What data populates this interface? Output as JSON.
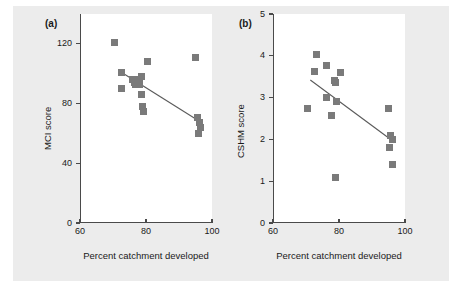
{
  "figure": {
    "background_color": "#ececec",
    "plot_background_color": "#ffffff",
    "marker_color": "#7a7a7a",
    "axis_color": "#4a4a4a",
    "line_color": "#5a5a5a"
  },
  "chart_data": [
    {
      "type": "scatter",
      "panel_label": "(a)",
      "title": "",
      "xlabel": "Percent catchment developed",
      "ylabel": "MCI score",
      "xlim": [
        60,
        100
      ],
      "ylim": [
        0,
        140
      ],
      "xticks": [
        60,
        80,
        100
      ],
      "xtick_labels": [
        "60",
        "80",
        "100"
      ],
      "yticks": [
        0,
        40,
        80,
        120
      ],
      "ytick_labels": [
        "0",
        "40",
        "80",
        "120"
      ],
      "grid": false,
      "legend": "none",
      "points": [
        {
          "x": 70.2,
          "y": 121
        },
        {
          "x": 72.3,
          "y": 101
        },
        {
          "x": 72.4,
          "y": 90
        },
        {
          "x": 75.6,
          "y": 96
        },
        {
          "x": 76.2,
          "y": 94
        },
        {
          "x": 76.4,
          "y": 93
        },
        {
          "x": 77.6,
          "y": 96
        },
        {
          "x": 77.8,
          "y": 93
        },
        {
          "x": 78.3,
          "y": 98
        },
        {
          "x": 78.4,
          "y": 86
        },
        {
          "x": 78.6,
          "y": 78
        },
        {
          "x": 79.0,
          "y": 75
        },
        {
          "x": 80.0,
          "y": 108
        },
        {
          "x": 94.8,
          "y": 111
        },
        {
          "x": 95.4,
          "y": 71
        },
        {
          "x": 95.8,
          "y": 67
        },
        {
          "x": 95.6,
          "y": 60
        },
        {
          "x": 96.2,
          "y": 64
        }
      ],
      "fit_line": {
        "x0": 71.5,
        "y0": 102,
        "x1": 96.0,
        "y1": 68
      }
    },
    {
      "type": "scatter",
      "panel_label": "(b)",
      "title": "",
      "xlabel": "Percent catchment developed",
      "ylabel": "CSHM score",
      "xlim": [
        60,
        100
      ],
      "ylim": [
        0,
        5
      ],
      "xticks": [
        60,
        80,
        100
      ],
      "xtick_labels": [
        "60",
        "80",
        "100"
      ],
      "yticks": [
        0,
        1,
        2,
        3,
        4,
        5
      ],
      "ytick_labels": [
        "0",
        "1",
        "2",
        "3",
        "4",
        "5"
      ],
      "grid": false,
      "legend": "none",
      "points": [
        {
          "x": 70.3,
          "y": 2.74
        },
        {
          "x": 72.4,
          "y": 3.62
        },
        {
          "x": 73.0,
          "y": 4.02
        },
        {
          "x": 75.8,
          "y": 3.77
        },
        {
          "x": 76.0,
          "y": 3.0
        },
        {
          "x": 77.5,
          "y": 2.58
        },
        {
          "x": 78.2,
          "y": 3.4
        },
        {
          "x": 78.6,
          "y": 3.36
        },
        {
          "x": 78.5,
          "y": 1.1
        },
        {
          "x": 79.0,
          "y": 2.9
        },
        {
          "x": 80.2,
          "y": 3.6
        },
        {
          "x": 94.6,
          "y": 2.73
        },
        {
          "x": 95.2,
          "y": 2.1
        },
        {
          "x": 95.0,
          "y": 1.81
        },
        {
          "x": 96.0,
          "y": 1.99
        },
        {
          "x": 95.8,
          "y": 1.4
        }
      ],
      "fit_line": {
        "x0": 71.0,
        "y0": 3.42,
        "x1": 96.2,
        "y1": 1.95
      }
    }
  ]
}
